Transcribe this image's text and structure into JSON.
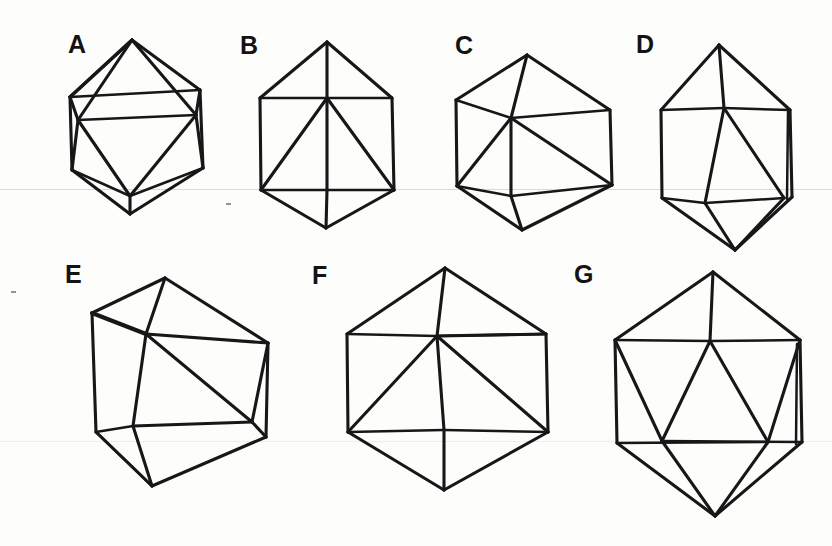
{
  "figure": {
    "background_color": "#fdfdfc",
    "ink_color": "#171717",
    "panel_count": 7,
    "rows": 2,
    "row_counts": [
      4,
      3
    ]
  },
  "labels": {
    "a": "A",
    "b": "B",
    "c": "C",
    "d": "D",
    "e": "E",
    "f": "F",
    "g": "G"
  },
  "panels": [
    {
      "id": "a",
      "label": "A",
      "label_x": 68,
      "label_y": 32,
      "caption": "icosahedron, vertex-up tilted view",
      "shape_type": "icosahedron-wireframe"
    },
    {
      "id": "b",
      "label": "B",
      "label_x": 240,
      "label_y": 33,
      "caption": "icosahedron, upright hexagonal silhouette",
      "shape_type": "icosahedron-wireframe"
    },
    {
      "id": "c",
      "label": "C",
      "label_x": 455,
      "label_y": 33,
      "caption": "icosahedron, rotated about vertical axis",
      "shape_type": "icosahedron-wireframe"
    },
    {
      "id": "d",
      "label": "D",
      "label_x": 636,
      "label_y": 32,
      "caption": "elongated icosahedron, near edge-on view",
      "shape_type": "icosahedron-wireframe"
    },
    {
      "id": "e",
      "label": "E",
      "label_x": 65,
      "label_y": 262,
      "caption": "icosahedron, obliquely tilted view",
      "shape_type": "icosahedron-wireframe"
    },
    {
      "id": "f",
      "label": "F",
      "label_x": 312,
      "label_y": 263,
      "caption": "icosahedron, wide hexagonal silhouette",
      "shape_type": "icosahedron-wireframe"
    },
    {
      "id": "g",
      "label": "G",
      "label_x": 574,
      "label_y": 262,
      "caption": "icosahedron, symmetric front view",
      "shape_type": "icosahedron-wireframe"
    }
  ],
  "geometry": {
    "a": {
      "outline": "132,40 200,90 203,168 130,214 72,168 70,97",
      "edges": [
        "132,40 72,168",
        "132,40 70,97",
        "132,40 203,168",
        "132,40 200,90",
        "70,97 203,168",
        "70,97 130,214",
        "203,168 130,214",
        "72,168 203,168",
        "72,168 130,214",
        "200,90 203,168"
      ]
    },
    "b": {
      "outline": "327,42 392,98 394,190 326,228 261,190 260,98",
      "edges": [
        "327,42 261,190",
        "327,42 260,98",
        "327,42 392,98",
        "327,42 394,190",
        "260,98 394,98",
        "260,98 261,190",
        "261,190 394,190",
        "261,190 326,228",
        "394,190 326,228",
        "327,42 327,190",
        "261,190 327,98",
        "394,190 327,98"
      ]
    },
    "c": {
      "outline": "527,55 610,110 612,185 522,230 457,184 456,100",
      "edges": [
        "527,55 456,100",
        "527,55 610,110",
        "527,55 511,116",
        "456,100 511,116",
        "610,110 511,116",
        "456,100 457,184",
        "610,110 612,185",
        "457,184 612,185",
        "511,116 457,184",
        "511,116 511,190",
        "511,116 612,185",
        "457,184 511,190",
        "612,185 511,190",
        "457,184 522,230",
        "511,190 522,230",
        "612,185 522,230"
      ]
    },
    "d": {
      "outline": "719,45 790,110 792,195 735,250 662,196 661,110",
      "edges": [
        "719,45 661,110",
        "719,45 790,110",
        "719,45 724,107",
        "661,110 724,107",
        "790,110 724,107",
        "661,110 662,196",
        "790,110 792,195",
        "724,107 704,200",
        "724,107 783,196",
        "662,196 783,196",
        "662,196 704,200",
        "704,200 783,196",
        "662,196 735,250",
        "704,200 735,250",
        "783,196 735,250",
        "790,110 788,198"
      ]
    },
    "e": {
      "outline": "165,278 268,343 266,437 152,486 96,430 92,313",
      "edges": [
        "165,278 92,313",
        "165,278 268,343",
        "165,278 146,332",
        "92,313 146,332",
        "146,332 268,343",
        "92,313 96,430",
        "268,343 266,437",
        "146,332 133,424",
        "146,332 250,420",
        "96,430 250,420",
        "96,430 133,424",
        "133,424 250,420",
        "250,420 266,437",
        "96,430 152,486",
        "133,424 152,486",
        "266,437 152,486",
        "250,420 266,437"
      ]
    },
    "f": {
      "outline": "445,268 546,334 548,430 444,490 348,430 347,334"
    },
    "g": {
      "outline": "713,272 800,340 802,440 715,516 617,441 615,340"
    }
  }
}
